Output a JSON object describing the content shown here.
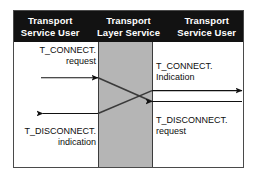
{
  "figure": {
    "type": "sequence-diagram",
    "title_columns": [
      {
        "line1": "Transport",
        "line2": "Service User"
      },
      {
        "line1": "Transport",
        "line2": "Layer Service"
      },
      {
        "line1": "Transport",
        "line2": "Service User"
      }
    ],
    "colors": {
      "header_background": "#121212",
      "header_text": "#ffffff",
      "middle_column": "#b5b5b5",
      "frame_border": "#4a4a4a",
      "arrow": "#111111",
      "body_background": "#ffffff"
    },
    "labels": {
      "connect_request": {
        "line1": "T_CONNECT.",
        "line2": "request"
      },
      "connect_indication": {
        "line1": "T_CONNECT.",
        "line2": "Indication"
      },
      "disconnect_request": {
        "line1": "T_DISCONNECT.",
        "line2": "request"
      },
      "disconnect_indication": {
        "line1": "T_DISCONNECT.",
        "line2": "indication"
      }
    },
    "messages": [
      {
        "name": "t-connect-request",
        "from": "left-user",
        "to": "transport-layer",
        "direction": "right"
      },
      {
        "name": "t-connect-indication",
        "from": "transport-layer",
        "to": "right-user",
        "direction": "right"
      },
      {
        "name": "t-disconnect-request",
        "from": "right-user",
        "to": "transport-layer",
        "direction": "left"
      },
      {
        "name": "t-disconnect-indication",
        "from": "transport-layer",
        "to": "left-user",
        "direction": "left"
      }
    ]
  }
}
